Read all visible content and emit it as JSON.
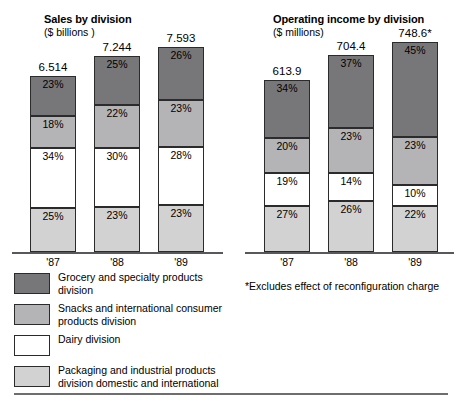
{
  "footnote": "*Excludes effect of reconfiguration charge",
  "legend": {
    "items": [
      {
        "swatch": "dark-grey",
        "color": "#77777a",
        "label": "Grocery and specialty products\ndivision"
      },
      {
        "swatch": "medium-grey",
        "color": "#b4b4b6",
        "label": "Snacks and international consumer\nproducts division"
      },
      {
        "swatch": "white",
        "color": "#ffffff",
        "label": "Dairy division"
      },
      {
        "swatch": "light-grey",
        "color": "#d2d2d2",
        "label": "Packaging and industrial products\ndivision domestic and international"
      }
    ]
  },
  "chart_data": [
    {
      "type": "bar",
      "id": "sales-by-division",
      "title": "Sales by division",
      "subtitle": "($ billions )",
      "xlabel": "",
      "ylabel": "",
      "stacked": true,
      "normalized": true,
      "grid": false,
      "legend_position": "below",
      "categories": [
        "'87",
        "'88",
        "'89"
      ],
      "totals": [
        "6.514",
        "7.244",
        "7.593"
      ],
      "total_values": [
        6.514,
        7.244,
        7.593
      ],
      "series": [
        {
          "name": "Grocery and specialty products division",
          "color": "#77777a",
          "values": [
            23,
            25,
            26
          ],
          "labels": [
            "23%",
            "25%",
            "26%"
          ]
        },
        {
          "name": "Snacks and international consumer products division",
          "color": "#b4b4b6",
          "values": [
            18,
            22,
            23
          ],
          "labels": [
            "18%",
            "22%",
            "23%"
          ]
        },
        {
          "name": "Dairy division",
          "color": "#ffffff",
          "values": [
            34,
            30,
            28
          ],
          "labels": [
            "34%",
            "30%",
            "28%"
          ]
        },
        {
          "name": "Packaging and industrial products division domestic and international",
          "color": "#d2d2d2",
          "values": [
            25,
            23,
            23
          ],
          "labels": [
            "25%",
            "23%",
            "23%"
          ]
        }
      ]
    },
    {
      "type": "bar",
      "id": "operating-income-by-division",
      "title": "Operating income by division",
      "subtitle": "($ millions)",
      "xlabel": "",
      "ylabel": "",
      "stacked": true,
      "normalized": true,
      "grid": false,
      "legend_position": "below",
      "categories": [
        "'87",
        "'88",
        "'89"
      ],
      "totals": [
        "613.9",
        "704.4",
        "748.6*"
      ],
      "total_values": [
        613.9,
        704.4,
        748.6
      ],
      "series": [
        {
          "name": "Grocery and specialty products division",
          "color": "#77777a",
          "values": [
            34,
            37,
            45
          ],
          "labels": [
            "34%",
            "37%",
            "45%"
          ]
        },
        {
          "name": "Snacks and international consumer products division",
          "color": "#b4b4b6",
          "values": [
            20,
            23,
            23
          ],
          "labels": [
            "20%",
            "23%",
            "23%"
          ]
        },
        {
          "name": "Dairy division",
          "color": "#ffffff",
          "values": [
            19,
            14,
            10
          ],
          "labels": [
            "19%",
            "14%",
            "10%"
          ]
        },
        {
          "name": "Packaging and industrial products division domestic and international",
          "color": "#d2d2d2",
          "values": [
            27,
            26,
            22
          ],
          "labels": [
            "27%",
            "26%",
            "22%"
          ]
        }
      ]
    }
  ]
}
